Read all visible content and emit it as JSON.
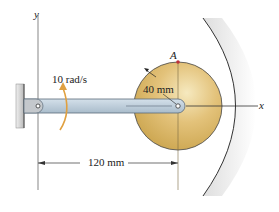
{
  "diagram": {
    "axes": {
      "x_label": "x",
      "y_label": "y"
    },
    "point_label": "A",
    "angular_velocity_label": "10 rad/s",
    "radius_label": "40 mm",
    "length_label": "120 mm",
    "colors": {
      "disk": "#d9b45c",
      "disk_light": "#f3e3b0",
      "bar": "#b9c9d6",
      "bar_edge": "#5a6a78",
      "wall": "#c8c8c8",
      "arrow": "#e0a040",
      "point_a": "#c0303a",
      "line": "#333333"
    }
  }
}
